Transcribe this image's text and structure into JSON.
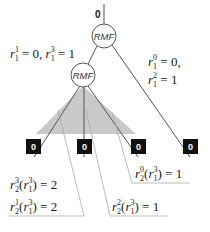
{
  "root": {
    "value": "0"
  },
  "nodes": [
    {
      "id": "rmf-top",
      "label": "RMF"
    },
    {
      "id": "rmf-child",
      "label": "RMF"
    }
  ],
  "leaves": [
    "0",
    "0",
    "0",
    "0"
  ],
  "branch_labels": {
    "left": {
      "line1_a": "r",
      "line1_a_sub": "1",
      "line1_a_sup": "1",
      "line1_a_rest": " = 0, ",
      "line1_b": "r",
      "line1_b_sub": "1",
      "line1_b_sup": "3",
      "line1_b_rest": " = 1"
    },
    "right": {
      "line1": {
        "r": "r",
        "sub": "1",
        "sup": "0",
        "rest": " = 0,"
      },
      "line2": {
        "r": "r",
        "sub": "1",
        "sup": "2",
        "rest": " = 1"
      }
    }
  },
  "callouts": [
    {
      "id": "r2-3",
      "r": "r",
      "sub": "2",
      "sup": "3",
      "arg_r": "r",
      "arg_sub": "1",
      "arg_sup": "3",
      "rest": " = 2"
    },
    {
      "id": "r2-1",
      "r": "r",
      "sub": "2",
      "sup": "1",
      "arg_r": "r",
      "arg_sub": "1",
      "arg_sup": "3",
      "rest": " = 2"
    },
    {
      "id": "r2-2",
      "r": "r",
      "sub": "2",
      "sup": "2",
      "arg_r": "r",
      "arg_sub": "1",
      "arg_sup": "3",
      "rest": " = 1"
    },
    {
      "id": "r2-0",
      "r": "r",
      "sub": "2",
      "sup": "0",
      "arg_r": "r",
      "arg_sub": "1",
      "arg_sup": "3",
      "rest": " = 1"
    }
  ],
  "colors": {
    "triangle_fill": "#c9c9c9",
    "triangle_stroke": "#555555",
    "leaf_fill": "#111111",
    "line": "#555555",
    "callout_line": "#aaaaaa"
  }
}
